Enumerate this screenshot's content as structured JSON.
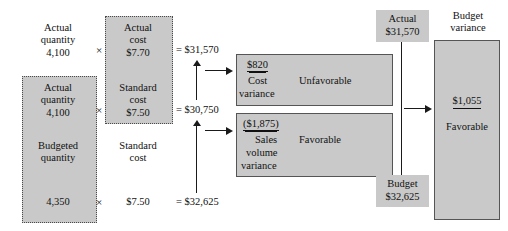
{
  "diagram": {
    "colors": {
      "shade": "#c9c9c9",
      "line": "#1a1a1a",
      "border": "#555555"
    },
    "quantity_column": {
      "rows": [
        {
          "label_line1": "Actual",
          "label_line2": "quantity",
          "value": "4,100",
          "shaded": false
        },
        {
          "label_line1": "Actual",
          "label_line2": "quantity",
          "value": "4,100",
          "shaded": true
        },
        {
          "label_line1": "Budgeted",
          "label_line2": "quantity",
          "value": "4,350",
          "shaded": true
        }
      ]
    },
    "cost_column": {
      "rows": [
        {
          "label_line1": "Actual",
          "label_line2": "cost",
          "value": "$7.70",
          "shaded": true
        },
        {
          "label_line1": "Standard",
          "label_line2": "cost",
          "value": "$7.50",
          "shaded": true
        },
        {
          "label_line1": "Standard",
          "label_line2": "cost",
          "value": "$7.50",
          "shaded": false
        }
      ]
    },
    "operators": {
      "multiply": "×",
      "equals": "="
    },
    "totals": [
      {
        "text": "$31,570"
      },
      {
        "text": "$30,750"
      },
      {
        "text": "$32,625"
      }
    ],
    "variance_boxes": [
      {
        "amount": "$820",
        "name_line1": "Cost",
        "name_line2": "variance",
        "verdict": "Unfavorable"
      },
      {
        "amount": "($1,875)",
        "name_line1": "Sales",
        "name_line2": "volume",
        "name_line3": "variance",
        "verdict": "Favorable"
      }
    ],
    "right_panel": {
      "actual": {
        "label": "Actual",
        "value": "$31,570"
      },
      "budget": {
        "label": "Budget",
        "value": "$32,625"
      },
      "budget_variance": {
        "title_line1": "Budget",
        "title_line2": "variance",
        "amount": "$1,055",
        "verdict": "Favorable"
      }
    }
  }
}
